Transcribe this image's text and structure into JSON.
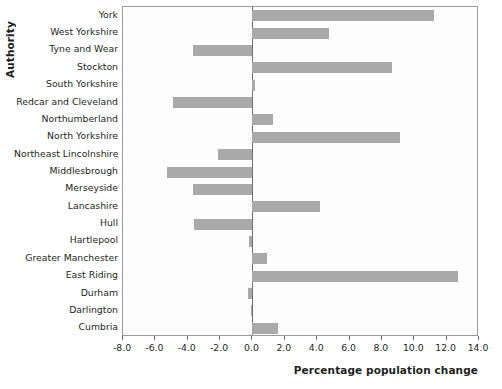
{
  "chart_data": {
    "type": "bar",
    "orientation": "horizontal",
    "title": "",
    "xlabel": "Percentage population change",
    "ylabel": "Authority",
    "xlim": [
      -8.0,
      14.0
    ],
    "xticks": [
      "-8.0",
      "-6.0",
      "-4.0",
      "-2.0",
      "0.0",
      "2.0",
      "4.0",
      "6.0",
      "8.0",
      "10.0",
      "12.0",
      "14.0"
    ],
    "xtick_values": [
      -8.0,
      -6.0,
      -4.0,
      -2.0,
      0.0,
      2.0,
      4.0,
      6.0,
      8.0,
      10.0,
      12.0,
      14.0
    ],
    "grid": false,
    "legend": "none",
    "bar_color": "#a9a9a9",
    "axis_color": "#6e6e6e",
    "categories": [
      "York",
      "West Yorkshire",
      "Tyne and Wear",
      "Stockton",
      "South Yorkshire",
      "Redcar and Cleveland",
      "Northumberland",
      "North Yorkshire",
      "Northeast Lincolnshire",
      "Middlesbrough",
      "Merseyside",
      "Lancashire",
      "Hull",
      "Hartlepool",
      "Greater Manchester",
      "East Riding",
      "Durham",
      "Darlington",
      "Cumbria"
    ],
    "values": [
      11.2,
      4.7,
      -3.7,
      8.6,
      0.15,
      -4.9,
      1.25,
      9.1,
      -2.1,
      -5.3,
      -3.7,
      4.2,
      -3.6,
      -0.2,
      0.9,
      12.7,
      -0.25,
      -0.1,
      1.6
    ]
  }
}
